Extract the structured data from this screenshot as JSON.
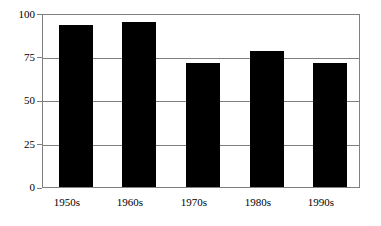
{
  "chart_data": {
    "type": "bar",
    "title": "",
    "subtitle": "",
    "xlabel": "",
    "ylabel": "",
    "categories": [
      "1950s",
      "1960s",
      "1970s",
      "1980s",
      "1990s"
    ],
    "values": [
      94,
      96,
      72,
      79,
      72
    ],
    "ylim": [
      0,
      100
    ],
    "yticks": [
      0,
      25,
      50,
      75,
      100
    ],
    "ytick_labels": [
      "0",
      "25",
      "50",
      "75",
      "100"
    ],
    "grid": "horizontal",
    "legend": "none",
    "annotations": [],
    "colors": {
      "bar": "#000000",
      "background": "#ffffff",
      "gridline": "#808080",
      "axis": "#808080",
      "text": "#000000"
    }
  }
}
